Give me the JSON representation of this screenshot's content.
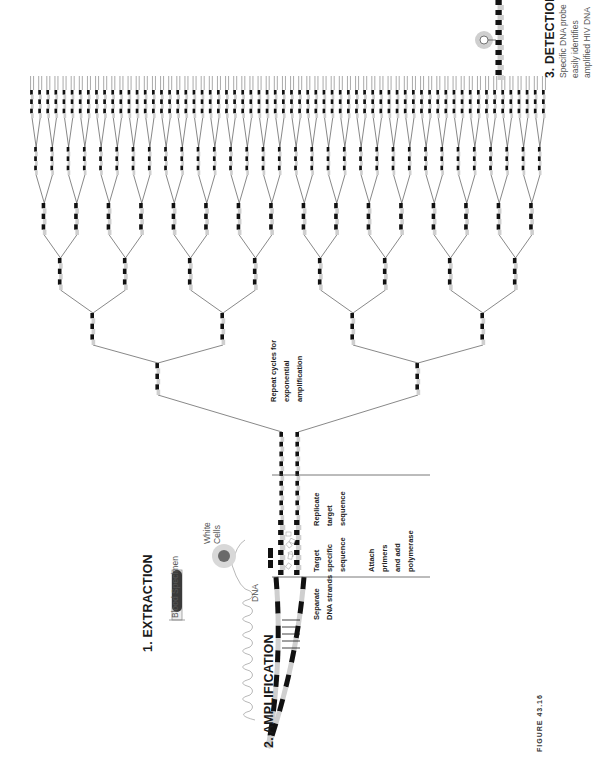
{
  "figure": {
    "label": "FIGURE 43.16"
  },
  "steps": {
    "extraction": {
      "heading": "1. EXTRACTION",
      "blood_specimen": "Blood Specimen",
      "white_cells_line1": "White",
      "white_cells_line2": "Cells",
      "dna": "DNA"
    },
    "amplification": {
      "heading": "2. AMPLIFICATION",
      "separate_line1": "Separate",
      "separate_line2": "DNA strands",
      "target_line1": "Target",
      "target_line2": "specific",
      "target_line3": "sequence",
      "attach_line1": "Attach",
      "attach_line2": "primers",
      "attach_line3": "and add",
      "attach_line4": "polymerase",
      "replicate_line1": "Replicate",
      "replicate_line2": "target",
      "replicate_line3": "sequence",
      "repeat_line1": "Repeat cycles for",
      "repeat_line2": "exponential",
      "repeat_line3": "amplification"
    },
    "detection": {
      "heading": "3. DETECTION",
      "line1": "Specific DNA probe",
      "line2": "easily identifies",
      "line3": "amplified HIV DNA"
    }
  },
  "tree": {
    "levels": 6,
    "root": {
      "x": 290,
      "y": 432
    },
    "level_y": [
      395,
      345,
      290,
      235,
      175,
      118
    ],
    "segment_len": [
      32,
      32,
      32,
      32,
      28,
      28
    ],
    "span": [
      28,
      548
    ]
  },
  "colors": {
    "ink": "#111111",
    "gray_block": "#cfcfcf",
    "line": "#555555",
    "cell": "#6a6a6a",
    "cell_halo": "#d8d8d8"
  }
}
